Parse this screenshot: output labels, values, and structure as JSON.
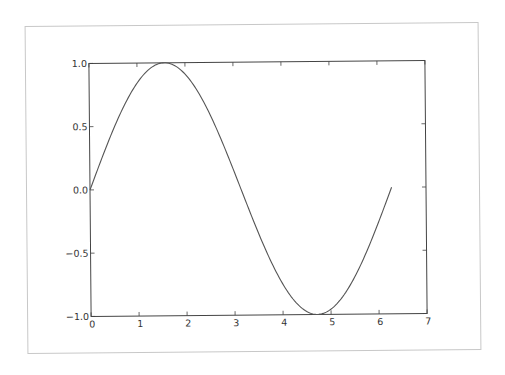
{
  "chart_data": {
    "type": "line",
    "title": "",
    "xlabel": "",
    "ylabel": "",
    "xlim": [
      0,
      7
    ],
    "ylim": [
      -1.0,
      1.0
    ],
    "grid": false,
    "legend": null,
    "x_ticks": [
      "0",
      "1",
      "2",
      "3",
      "4",
      "5",
      "6",
      "7"
    ],
    "y_ticks": [
      "1.0",
      "0.5",
      "0.0",
      "−0.5",
      "−1.0"
    ],
    "series": [
      {
        "name": "sin(x)",
        "function": "sin",
        "x_start": 0,
        "x_end": 6.283,
        "x": [
          0,
          0.5,
          1.0,
          1.5708,
          2.0,
          2.5,
          3.0,
          3.1416,
          3.5,
          4.0,
          4.5,
          4.7124,
          5.0,
          5.5,
          6.0,
          6.283
        ],
        "y": [
          0,
          0.479,
          0.841,
          1.0,
          0.909,
          0.598,
          0.141,
          0.0,
          -0.351,
          -0.757,
          -0.978,
          -1.0,
          -0.959,
          -0.706,
          -0.279,
          0.0
        ],
        "color": "#555555"
      }
    ]
  },
  "style": {
    "axes_color": "#444444",
    "frame_color": "#c8c8c8",
    "line_color": "#555555"
  }
}
